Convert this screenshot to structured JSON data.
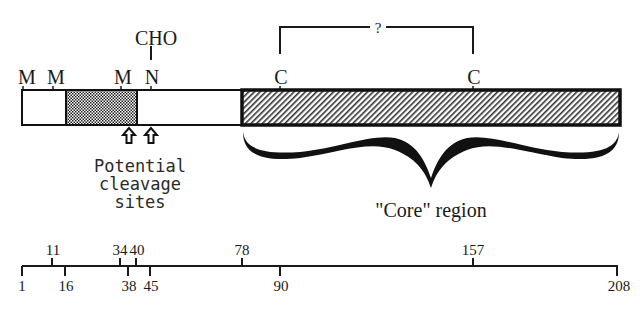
{
  "diagram": {
    "top_labels": {
      "m1": "M",
      "m2": "M",
      "m3": "M",
      "n": "N",
      "cho": "CHO",
      "c1": "C",
      "c2": "C",
      "disulfide_question": "?"
    },
    "segments": [
      {
        "name": "n-terminal-white",
        "fill": "white",
        "start_px": 22,
        "end_px": 66
      },
      {
        "name": "stippled-region",
        "fill": "stipple",
        "start_px": 66,
        "end_px": 137
      },
      {
        "name": "middle-white",
        "fill": "white",
        "start_px": 137,
        "end_px": 242
      },
      {
        "name": "core-hatched",
        "fill": "hatch",
        "start_px": 242,
        "end_px": 620
      }
    ],
    "cleavage_label_lines": [
      "Potential",
      "cleavage",
      "sites"
    ],
    "core_label": "\"Core\" region",
    "scale": {
      "above": [
        {
          "value": "11",
          "x": 52
        },
        {
          "value": "34",
          "x": 120
        },
        {
          "value": "40",
          "x": 136
        },
        {
          "value": "78",
          "x": 242
        },
        {
          "value": "157",
          "x": 473
        }
      ],
      "below": [
        {
          "value": "1",
          "x": 22
        },
        {
          "value": "16",
          "x": 65
        },
        {
          "value": "38",
          "x": 128
        },
        {
          "value": "45",
          "x": 150
        },
        {
          "value": "90",
          "x": 280
        },
        {
          "value": "208",
          "x": 617
        }
      ]
    },
    "colors": {
      "ink": "#1a1a1a",
      "background": "#ffffff"
    }
  }
}
